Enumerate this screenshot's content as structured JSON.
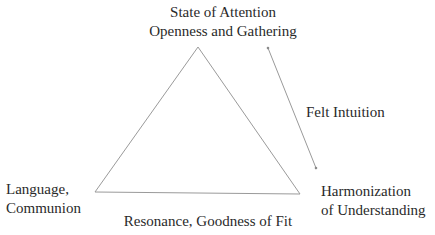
{
  "diagram": {
    "type": "triangle-concept-diagram",
    "vertices": {
      "top": {
        "line1": "State of Attention",
        "line2": "Openness and Gathering"
      },
      "bottom_left": {
        "line1": "Language,",
        "line2": "Communion"
      },
      "bottom_right": {
        "line1": "Harmonization",
        "line2": "of Understanding"
      }
    },
    "edges": {
      "bottom": "Resonance, Goodness of Fit"
    },
    "arrow": {
      "label": "Felt Intuition",
      "direction": "bidirectional"
    },
    "colors": {
      "line": "#9a9a9a",
      "text": "#2a2a2a",
      "background": "#ffffff"
    }
  }
}
